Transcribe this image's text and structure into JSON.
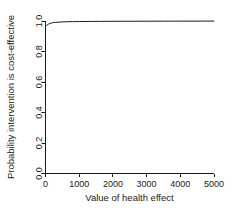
{
  "chart_data": {
    "type": "line",
    "title": "",
    "subtitle": "",
    "xlabel": "Value of health effect",
    "ylabel": "Probability intervention is cost-effective",
    "xlim": [
      0,
      5000
    ],
    "ylim": [
      0.0,
      1.0
    ],
    "xticks": [
      0,
      1000,
      2000,
      3000,
      4000,
      5000
    ],
    "xtick_labels": [
      "0",
      "1000",
      "2000",
      "3000",
      "4000",
      "5000"
    ],
    "yticks": [
      0.0,
      0.2,
      0.4,
      0.6,
      0.8,
      1.0
    ],
    "ytick_labels": [
      "0.0",
      "0.2",
      "0.4",
      "0.6",
      "0.8",
      "1.0"
    ],
    "grid": false,
    "legend": false,
    "legend_position": "none",
    "line_color": "#1a1a1a",
    "background_color": "#ffffff",
    "series": [
      {
        "name": "Probability cost-effective",
        "x": [
          0,
          25,
          50,
          75,
          100,
          150,
          200,
          250,
          300,
          400,
          500,
          600,
          700,
          800,
          900,
          1000,
          1200,
          1400,
          1600,
          1800,
          2000,
          2250,
          2500,
          2750,
          3000,
          3250,
          3500,
          3750,
          4000,
          4250,
          4500,
          4750,
          5000
        ],
        "y": [
          0.963,
          0.969,
          0.974,
          0.978,
          0.981,
          0.985,
          0.988,
          0.99,
          0.991,
          0.993,
          0.994,
          0.995,
          0.9955,
          0.996,
          0.9963,
          0.9966,
          0.997,
          0.9973,
          0.9976,
          0.9978,
          0.998,
          0.9982,
          0.9984,
          0.9986,
          0.9987,
          0.9988,
          0.9989,
          0.999,
          0.9991,
          0.9992,
          0.9993,
          0.9994,
          0.9995
        ]
      }
    ]
  },
  "axes": {
    "x_title": "Value of health effect",
    "y_title": "Probability intervention is cost-effective"
  }
}
